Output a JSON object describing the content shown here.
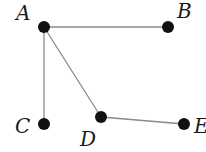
{
  "diagram": {
    "type": "graph",
    "nodes": [
      {
        "id": "A",
        "label": "A",
        "x": 44,
        "y": 27,
        "label_x": 16,
        "label_y": 20
      },
      {
        "id": "B",
        "label": "B",
        "x": 168,
        "y": 27,
        "label_x": 177,
        "label_y": 18
      },
      {
        "id": "C",
        "label": "C",
        "x": 44,
        "y": 124,
        "label_x": 15,
        "label_y": 133
      },
      {
        "id": "D",
        "label": "D",
        "x": 101,
        "y": 117,
        "label_x": 80,
        "label_y": 146
      },
      {
        "id": "E",
        "label": "E",
        "x": 184,
        "y": 124,
        "label_x": 194,
        "label_y": 133
      }
    ],
    "edges": [
      {
        "from": "A",
        "to": "B"
      },
      {
        "from": "A",
        "to": "C"
      },
      {
        "from": "A",
        "to": "D"
      },
      {
        "from": "D",
        "to": "E"
      }
    ],
    "colors": {
      "node": "#111111",
      "edge": "#8a8a8a",
      "label": "#1a1a1a",
      "background": "#ffffff"
    }
  }
}
